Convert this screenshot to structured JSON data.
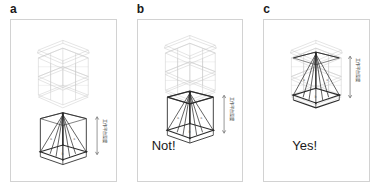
{
  "figure": {
    "background": "#ffffff",
    "border_color": "#d2d2d2",
    "wireframe_color": "#c9c9c9",
    "pyramid_color": "#2b2b2b",
    "text_color": "#1a1a1a",
    "panel_count": 3
  },
  "panels": [
    {
      "label": "a",
      "verdict": "",
      "content": "scaffold wireframe above separate tensegrity pyramid diagram",
      "objects": [
        "gray-wireframe-scaffold",
        "dark-pyramid-diagram"
      ],
      "vertical_label": "工作平台高度",
      "edge_labels": [
        "a",
        "a",
        "b"
      ]
    },
    {
      "label": "b",
      "verdict": "Not!",
      "content": "pyramid placed below the scaffold wireframe, misaligned",
      "objects": [
        "gray-wireframe-scaffold",
        "dark-pyramid-diagram"
      ],
      "vertical_label": "工作平台高度",
      "edge_labels": [
        "a",
        "a",
        "b"
      ]
    },
    {
      "label": "c",
      "verdict": "Yes!",
      "content": "pyramid superimposed inside the scaffold wireframe, aligned",
      "objects": [
        "gray-wireframe-scaffold",
        "dark-pyramid-diagram"
      ],
      "vertical_label": "工作平台高度",
      "edge_labels": [
        "a",
        "a",
        "b"
      ]
    }
  ]
}
